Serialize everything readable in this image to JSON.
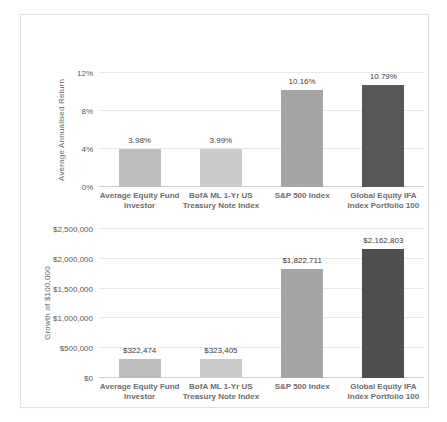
{
  "chart_data": [
    {
      "type": "bar",
      "title": "",
      "ylabel": "Average Annualised Return",
      "xlabel": "",
      "categories": [
        "Average Equity Fund\nInvestor",
        "BofA ML 1-Yr US\nTreasury Note Index",
        "S&P 500 Index",
        "Global Equity IFA\nIndex Portfolio 100"
      ],
      "values": [
        3.98,
        3.99,
        10.16,
        10.79
      ],
      "value_labels": [
        "3.98%",
        "3.99%",
        "10.16%",
        "10.79%"
      ],
      "ylim": [
        0,
        12
      ],
      "yticks": [
        0,
        4,
        8,
        12
      ],
      "ytick_labels": [
        "0%",
        "4%",
        "8%",
        "12%"
      ],
      "grid": true,
      "legend": false,
      "bar_colors": [
        "#bdbdbd",
        "#cbcbcb",
        "#a5a5a5",
        "#575757"
      ]
    },
    {
      "type": "bar",
      "title": "",
      "ylabel": "Growth of $100,000",
      "xlabel": "",
      "categories": [
        "Average Equity Fund\nInvestor",
        "BofA ML 1-Yr US\nTreasury Note Index",
        "S&P 500 Index",
        "Global Equity IFA\nIndex Portfolio 100"
      ],
      "values": [
        322474,
        323405,
        1822711,
        2162803
      ],
      "value_labels": [
        "$322,474",
        "$323,405",
        "$1,822,711",
        "$2,162,803"
      ],
      "ylim": [
        0,
        2500000
      ],
      "yticks": [
        0,
        500000,
        1000000,
        1500000,
        2000000,
        2500000
      ],
      "ytick_labels": [
        "$0",
        "$500,000",
        "$1,000,000",
        "$1,500,000",
        "$2,000,000",
        "$2,500,000"
      ],
      "grid": true,
      "legend": false,
      "bar_colors": [
        "#bdbdbd",
        "#cbcbcb",
        "#a5a5a5",
        "#4f4f4f"
      ]
    }
  ]
}
